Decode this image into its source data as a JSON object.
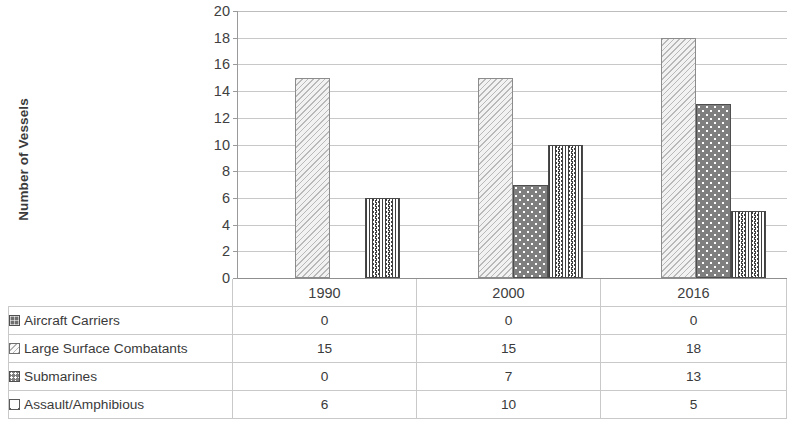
{
  "chart_data": {
    "type": "bar",
    "title": "",
    "xlabel": "",
    "ylabel": "Number of Vessels",
    "categories": [
      "1990",
      "2000",
      "2016"
    ],
    "ylim": [
      0,
      20
    ],
    "ytick_step": 2,
    "yticks": [
      "20",
      "18",
      "16",
      "14",
      "12",
      "10",
      "8",
      "6",
      "4",
      "2",
      "0"
    ],
    "grid": true,
    "legend_position": "data-table",
    "series": [
      {
        "name": "Aircraft Carriers",
        "values": [
          0,
          0,
          0
        ],
        "swatch": "swatch-dark-grid",
        "color": "#6f6f6f"
      },
      {
        "name": "Large Surface Combatants",
        "values": [
          15,
          15,
          18
        ],
        "swatch": "swatch-light-hatch",
        "color": "#f2f2f2"
      },
      {
        "name": "Submarines",
        "values": [
          0,
          7,
          13
        ],
        "swatch": "swatch-dark-dots",
        "color": "#7f7f7f"
      },
      {
        "name": "Assault/Amphibious",
        "values": [
          6,
          10,
          5
        ],
        "swatch": "swatch-zigzag",
        "color": "#ffffff"
      }
    ]
  },
  "axis": {
    "y_title": "Number of Vessels"
  },
  "table": {
    "header_blank": "",
    "columns": [
      "1990",
      "2000",
      "2016"
    ],
    "rows": [
      {
        "label": "Aircraft Carriers",
        "values": [
          "0",
          "0",
          "0"
        ]
      },
      {
        "label": "Large Surface Combatants",
        "values": [
          "15",
          "15",
          "18"
        ]
      },
      {
        "label": "Submarines",
        "values": [
          "0",
          "7",
          "13"
        ]
      },
      {
        "label": "Assault/Amphibious",
        "values": [
          "6",
          "10",
          "5"
        ]
      }
    ]
  }
}
